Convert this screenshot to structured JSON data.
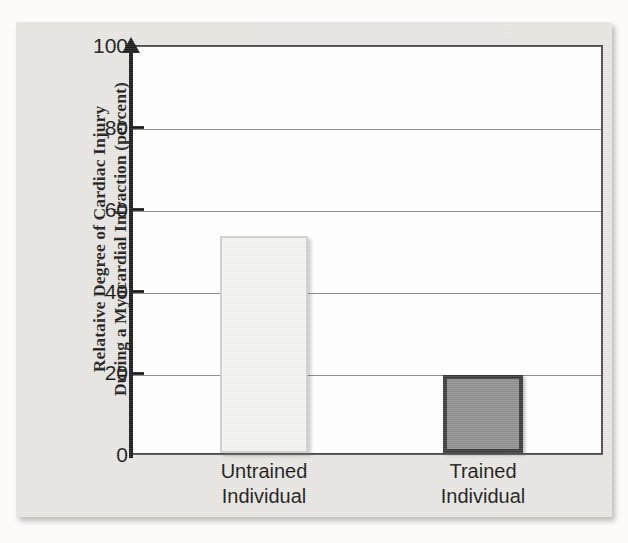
{
  "chart_data": {
    "type": "bar",
    "title": "",
    "subtitle": "",
    "xlabel": "",
    "ylabel": "Relataive Degree of Cardiac Injury During a Myocardial Infraction (percent)",
    "ylabel_lines": [
      "Relataive Degree of Cardiac Injury",
      "During a Myocardial Infraction (percent)"
    ],
    "categories": [
      "Untrained Individual",
      "Trained Individual"
    ],
    "category_lines": [
      [
        "Untrained",
        "Individual"
      ],
      [
        "Trained",
        "Individual"
      ]
    ],
    "values": [
      53,
      19
    ],
    "ylim": [
      0,
      100
    ],
    "ytick_values": [
      0,
      20,
      40,
      60,
      80,
      100
    ],
    "ytick_labels": [
      "0",
      "20",
      "40",
      "60",
      "80",
      "100"
    ],
    "grid": true,
    "grid_axis": "y",
    "legend": false,
    "legend_position": "none",
    "bar_colors": [
      "#f2f2f0",
      "#8e8e8e"
    ],
    "bar_edge_colors": [
      "#cfcfcc",
      "#3a3a3a"
    ],
    "axis_color": "#1a1a1a",
    "grid_color": "#8f8f8f",
    "plot_background": "#ffffff",
    "figure_background": "#e6e5e2"
  },
  "axis": {
    "ticks": [
      {
        "label": "100",
        "value": 100
      },
      {
        "label": "80",
        "value": 80
      },
      {
        "label": "60",
        "value": 60
      },
      {
        "label": "40",
        "value": 40
      },
      {
        "label": "20",
        "value": 20
      },
      {
        "label": "0",
        "value": 0
      }
    ]
  }
}
